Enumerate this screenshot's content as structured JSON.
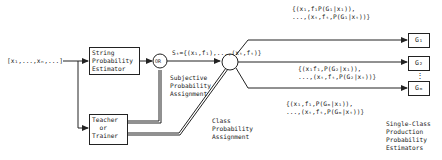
{
  "input_sequence": "[x₁,...,xₙ,...]",
  "blocks": {
    "string_estimator": "String\nProbability\nEstimator",
    "teacher": "Teacher\n  or\nTrainer",
    "or_gate": "OR"
  },
  "labels": {
    "sample_set": "Sₜ={(x₁,f₁),...,(xₜ,fₜ)}",
    "subjective": "Subjective\nProbability\nAssignment",
    "class_prob": "Class\nProbability\nAssignment",
    "estimators_caption": "Single-Class\nProduction\nProbability\nEstimators"
  },
  "branches": [
    {
      "set": "{(x₁,f₁P(G₁|x₁)),\n...,(xₜ,fₜ,P(G₁|xₜ))}",
      "class": "G₁"
    },
    {
      "set": "{(x₁f₁,P(G₂|x₁)),\n...,(xₜ,fₜ,P(G₂|xₜ))}",
      "class": "G₂"
    },
    {
      "set": "{(x₁,f₁,P(Gₘ|x₁)),\n...,(xₜ,fₜ,P(Gₘ|xₜ))}",
      "class": "Gₘ"
    }
  ],
  "ellipsis": "⋮"
}
